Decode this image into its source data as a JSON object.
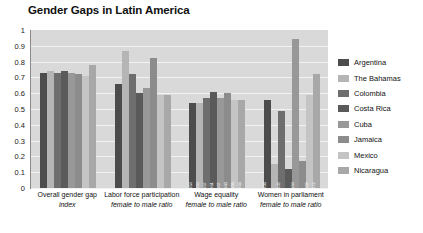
{
  "chart_data": {
    "type": "bar",
    "title": "Gender Gaps in Latin America",
    "xlabel": "",
    "ylabel": "",
    "ylim": [
      0,
      1
    ],
    "yticks": [
      "1",
      "0.9",
      "0.8",
      "0.7",
      "0.6",
      "0.5",
      "0.4",
      "0.3",
      "0.2",
      "0.1",
      "0"
    ],
    "grid": true,
    "legend_position": "right",
    "categories": [
      {
        "line1": "Overall gender gap",
        "line2": "index"
      },
      {
        "line1": "Labor force participation",
        "line2": "female to male ratio"
      },
      {
        "line1": "Wage equality",
        "line2": "female to male ratio"
      },
      {
        "line1": "Women in parliament",
        "line2": "female to male ratio"
      }
    ],
    "series": [
      {
        "name": "Argentina",
        "color": "#4c4c4c",
        "values": [
          0.73,
          0.66,
          0.54,
          0.56
        ]
      },
      {
        "name": "The Bahamas",
        "color": "#b5b5b5",
        "values": [
          0.74,
          0.87,
          0.54,
          0.15
        ]
      },
      {
        "name": "Colombia",
        "color": "#6e6e6e",
        "values": [
          0.73,
          0.72,
          0.57,
          0.49
        ]
      },
      {
        "name": "Costa Rica",
        "color": "#5a5a5a",
        "values": [
          0.74,
          0.6,
          0.61,
          0.12
        ]
      },
      {
        "name": "Cuba",
        "color": "#989898",
        "values": [
          0.73,
          0.63,
          0.57,
          0.94
        ]
      },
      {
        "name": "Jamaica",
        "color": "#8c8c8c",
        "values": [
          0.72,
          0.82,
          0.6,
          0.17
        ]
      },
      {
        "name": "Mexico",
        "color": "#c4c4c4",
        "values": [
          0.71,
          0.59,
          0.56,
          0.59
        ]
      },
      {
        "name": "Nicaragua",
        "color": "#a8a8a8",
        "values": [
          0.78,
          0.59,
          0.56,
          0.72
        ]
      }
    ],
    "data_labels": {
      "group3": [
        "0.54",
        "0.54",
        "0.57",
        "0.61",
        "0.57",
        "0.60",
        "0.56",
        "0.56"
      ],
      "group4": [
        "0.56",
        "",
        "0.49",
        "",
        "0.94",
        "",
        "0.59",
        "0.72"
      ]
    }
  },
  "plot": {
    "background": "#d9d9d9",
    "gridline_color": "#f2f2f2",
    "axis_color": "#8a8a8a"
  }
}
